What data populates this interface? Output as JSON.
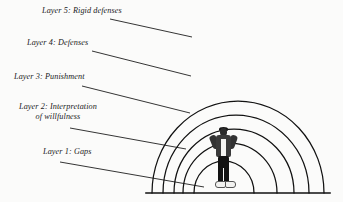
{
  "diagram": {
    "background_color": "#fbfbfa",
    "line_color": "#111111",
    "center_subject": "person-standing",
    "baseline": {
      "name": "ground-baseline",
      "x1": 146,
      "y1": 193,
      "x2": 330,
      "y2": 193
    },
    "labels": [
      {
        "id": "layer5",
        "text": "Layer 5: Rigid defenses",
        "lines": [
          "Layer 5: Rigid defenses"
        ],
        "leader": {
          "x1": 110,
          "y1": 19,
          "x2": 192,
          "y2": 37
        }
      },
      {
        "id": "layer4",
        "text": "Layer 4: Defenses",
        "lines": [
          "Layer 4: Defenses"
        ],
        "leader": {
          "x1": 92,
          "y1": 51,
          "x2": 191,
          "y2": 76
        }
      },
      {
        "id": "layer3",
        "text": "Layer 3: Punishment",
        "lines": [
          "Layer 3: Punishment"
        ],
        "leader": {
          "x1": 82,
          "y1": 86,
          "x2": 190,
          "y2": 113
        }
      },
      {
        "id": "layer2",
        "text": "Layer 2: Interpretation of willfulness",
        "lines": [
          "Layer 2: Interpretation",
          "of willfulness"
        ],
        "leader": {
          "x1": 70,
          "y1": 128,
          "x2": 186,
          "y2": 149
        }
      },
      {
        "id": "layer1",
        "text": "Layer 1: Gaps",
        "lines": [
          "Layer 1: Gaps"
        ],
        "leader": {
          "x1": 60,
          "y1": 162,
          "x2": 204,
          "y2": 187
        }
      }
    ],
    "arcs": [
      {
        "id": "arc-layer5",
        "label_ref": "layer5",
        "cx": 238,
        "rx": 86,
        "ry": 92
      },
      {
        "id": "arc-layer4",
        "label_ref": "layer4",
        "cx": 236,
        "rx": 73,
        "ry": 78
      },
      {
        "id": "arc-layer3",
        "label_ref": "layer3",
        "cx": 234,
        "rx": 60,
        "ry": 64
      },
      {
        "id": "arc-layer2",
        "label_ref": "layer2",
        "cx": 230,
        "rx": 47,
        "ry": 50
      },
      {
        "id": "arc-layer1",
        "label_ref": "layer1",
        "cx": 224,
        "rx": 30,
        "ry": 32
      }
    ]
  }
}
